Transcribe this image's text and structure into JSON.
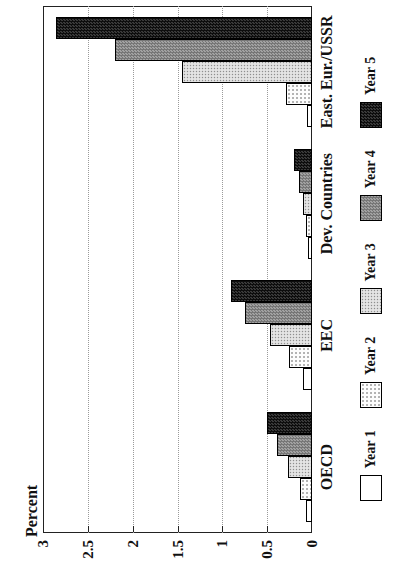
{
  "chart_data": {
    "type": "bar",
    "title": "",
    "ylabel": "Percent",
    "xlabel": "",
    "ylim": [
      0,
      3
    ],
    "yticks": [
      0,
      0.5,
      1,
      1.5,
      2,
      2.5,
      3
    ],
    "ytick_labels": [
      "0",
      "0.5",
      "1",
      "1.5",
      "2",
      "2.5",
      "3"
    ],
    "grid": "dotted gridlines at each 0.5 step",
    "legend_position": "below-axis",
    "figure_rotation": "chart rendered landscape and rotated 90deg CCW on portrait page",
    "categories": [
      "OECD",
      "EEC",
      "Dev. Countries",
      "East. Eur./USSR"
    ],
    "series": [
      {
        "name": "Year 1",
        "fill": "#ffffff",
        "pattern": "solid-white",
        "values": [
          0.07,
          0.1,
          0.04,
          0.06
        ]
      },
      {
        "name": "Year 2",
        "fill": "#f9f9f9",
        "pattern": "fine-dots",
        "values": [
          0.13,
          0.26,
          0.07,
          0.29
        ]
      },
      {
        "name": "Year 3",
        "fill": "#e0e0e0",
        "pattern": "light-dots",
        "values": [
          0.27,
          0.47,
          0.1,
          1.45
        ]
      },
      {
        "name": "Year 4",
        "fill": "#8c8c8c",
        "pattern": "dark-checker",
        "values": [
          0.39,
          0.75,
          0.15,
          2.2
        ]
      },
      {
        "name": "Year 5",
        "fill": "#262626",
        "pattern": "black-checker",
        "values": [
          0.5,
          0.9,
          0.2,
          2.85
        ]
      }
    ],
    "frame_color": "#222222",
    "grid_color": "#9a9a9a"
  }
}
